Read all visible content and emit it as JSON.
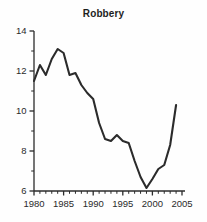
{
  "chart_data": {
    "type": "line",
    "title": "Robbery",
    "xlabel": "",
    "ylabel": "",
    "xlim": [
      1980,
      2005
    ],
    "ylim": [
      6,
      14
    ],
    "grid": false,
    "legend": null,
    "x_ticks_major": [
      1980,
      1985,
      1990,
      1995,
      2000,
      2005
    ],
    "x_ticks_minor_step": 1,
    "y_ticks_major": [
      6,
      8,
      10,
      12,
      14
    ],
    "y_ticks_minor_step": 1,
    "line_color": "#2b2b2b",
    "line_width": 2.1,
    "x": [
      1980,
      1981,
      1982,
      1983,
      1984,
      1985,
      1986,
      1987,
      1988,
      1989,
      1990,
      1991,
      1992,
      1993,
      1994,
      1995,
      1996,
      1997,
      1998,
      1999,
      2000,
      2001,
      2002,
      2003,
      2004
    ],
    "values": [
      11.5,
      12.3,
      11.8,
      12.6,
      13.1,
      12.9,
      11.8,
      11.9,
      11.3,
      10.9,
      10.6,
      9.4,
      8.6,
      8.5,
      8.8,
      8.5,
      8.4,
      7.5,
      6.7,
      6.15,
      6.6,
      7.1,
      7.3,
      8.3,
      10.3
    ]
  },
  "axis_labels": {
    "y": [
      "14",
      "12",
      "10",
      "8",
      "6"
    ],
    "x": [
      "1980",
      "1985",
      "1990",
      "1995",
      "2000",
      "2005"
    ]
  }
}
